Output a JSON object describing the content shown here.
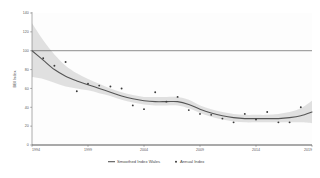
{
  "chart_data": {
    "type": "line",
    "title": "",
    "xlabel": "",
    "ylabel": "BBI Index",
    "xlim": [
      1994,
      2019
    ],
    "ylim": [
      0,
      140
    ],
    "grid": false,
    "legend_position": "bottom-center",
    "xticks": [
      "1994",
      "1999",
      "2004",
      "2009",
      "2014",
      "2019"
    ],
    "xtick_values": [
      1994,
      1999,
      2004,
      2009,
      2014,
      2019
    ],
    "yticks": [
      "0",
      "20",
      "40",
      "60",
      "80",
      "100",
      "120",
      "140"
    ],
    "ytick_values": [
      0,
      20,
      40,
      60,
      80,
      100,
      120,
      140
    ],
    "reference_line": {
      "label": "",
      "y": 100
    },
    "series": [
      {
        "name": "Smoothed Index Wales",
        "type": "line",
        "x": [
          1994,
          1995,
          1996,
          1997,
          1998,
          1999,
          2000,
          2001,
          2002,
          2003,
          2004,
          2005,
          2006,
          2007,
          2008,
          2009,
          2010,
          2011,
          2012,
          2013,
          2014,
          2015,
          2016,
          2017,
          2018,
          2019
        ],
        "values": [
          100,
          90,
          80,
          73,
          68,
          64,
          60,
          56,
          52,
          49,
          47,
          46,
          46,
          46,
          43,
          38,
          34,
          31,
          29,
          28,
          28,
          28,
          28,
          29,
          31,
          35
        ]
      },
      {
        "name": "Annual Index",
        "type": "scatter",
        "x": [
          1995,
          1996,
          1997,
          1998,
          1999,
          2000,
          2001,
          2002,
          2003,
          2004,
          2005,
          2006,
          2007,
          2008,
          2009,
          2010,
          2011,
          2012,
          2013,
          2014,
          2015,
          2016,
          2017,
          2018
        ],
        "values": [
          92,
          84,
          88,
          57,
          65,
          63,
          62,
          60,
          42,
          38,
          56,
          46,
          51,
          37,
          33,
          32,
          28,
          24,
          33,
          27,
          35,
          24,
          24,
          40
        ]
      }
    ],
    "confidence_band": {
      "name": "confidence-interval",
      "x": [
        1994,
        1995,
        1996,
        1997,
        1998,
        1999,
        2000,
        2001,
        2002,
        2003,
        2004,
        2005,
        2006,
        2007,
        2008,
        2009,
        2010,
        2011,
        2012,
        2013,
        2014,
        2015,
        2016,
        2017,
        2018,
        2019
      ],
      "upper": [
        129,
        111,
        96,
        84,
        76,
        70,
        65,
        60,
        56,
        53,
        51,
        51,
        51,
        51,
        48,
        42,
        38,
        35,
        33,
        32,
        32,
        32,
        33,
        35,
        39,
        47
      ],
      "lower": [
        72,
        70,
        66,
        62,
        60,
        58,
        55,
        52,
        48,
        45,
        43,
        42,
        42,
        42,
        39,
        34,
        30,
        27,
        25,
        24,
        24,
        24,
        24,
        24,
        24,
        23
      ]
    }
  },
  "legend": {
    "items": [
      {
        "label": "Smoothed Index Wales",
        "marker": "line",
        "color": "#555555"
      },
      {
        "label": "Annual Index",
        "marker": "dot",
        "color": "#3a3a3a"
      }
    ]
  },
  "colors": {
    "line": "#555555",
    "band": "#d6d6d6",
    "point": "#3a3a3a",
    "axis": "#666666",
    "reference": "#5a5a5a",
    "background": "#ffffff"
  }
}
